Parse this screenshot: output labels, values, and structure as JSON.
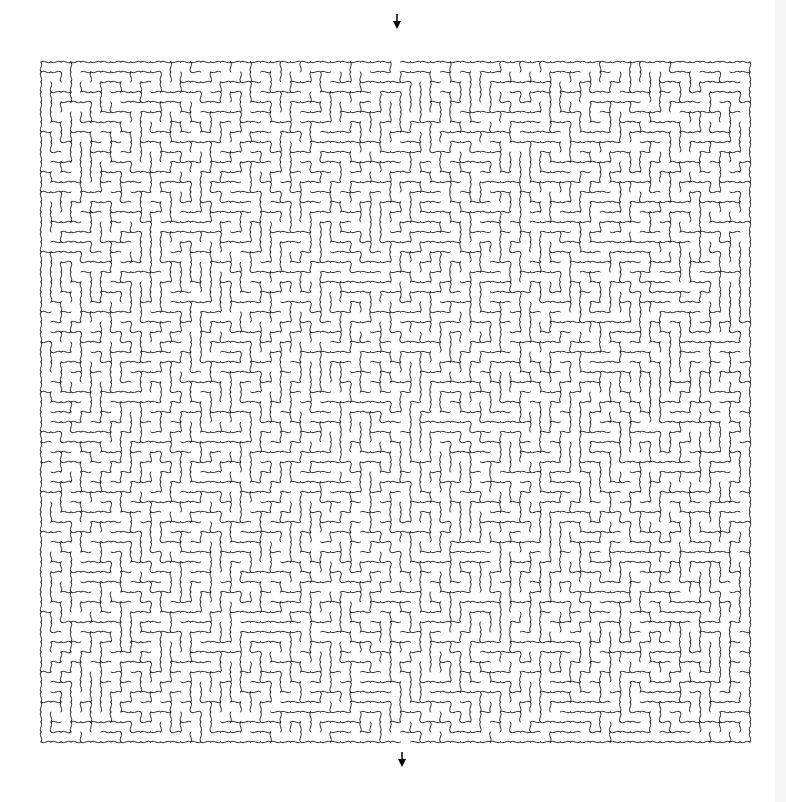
{
  "maze": {
    "type": "rectangular-maze-wavy-walls",
    "origin_x": 41,
    "origin_y": 62,
    "width_px": 709,
    "height_px": 680,
    "cols": 71,
    "rows": 68,
    "seed": 1337,
    "wall_color": "#222222",
    "wall_width": 1,
    "background": "#ffffff",
    "entrance": {
      "label": "start-arrow",
      "col": 35,
      "side": "top",
      "arrow_x": 397,
      "arrow_y": 42
    },
    "exit": {
      "label": "end-arrow",
      "col": 36,
      "side": "bottom",
      "arrow_x": 402,
      "arrow_y": 752
    },
    "arrow_color": "#000000"
  },
  "page": {
    "scroll_strip_color": "#f7f7f7"
  }
}
